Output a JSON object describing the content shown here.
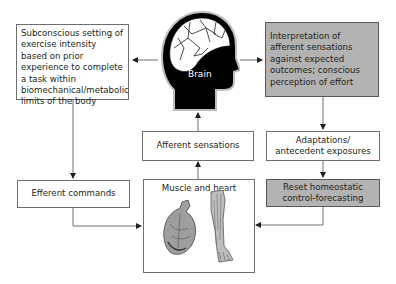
{
  "diagram": {
    "brain": {
      "label": "Brain",
      "icon": "head-brain-icon"
    },
    "subconscious_box": {
      "text": "Subconscious setting of exercise intensity based on prior experience to complete a task within biomechanical/metabolic limits of the body"
    },
    "interpretation_box": {
      "text": "Interpretation of afferent sensations against expected outcomes; conscious perception of effort",
      "fill": "#b3b3b3"
    },
    "afferent_box": {
      "text": "Afferent sensations"
    },
    "adaptations_box": {
      "text": "Adaptations/ antecedent exposures"
    },
    "efferent_box": {
      "text": "Efferent commands"
    },
    "reset_box": {
      "text": "Reset homeostatic control-forecasting",
      "fill": "#b3b3b3"
    },
    "muscle_heart_box": {
      "label": "Muscle and heart",
      "icons": [
        "heart-icon",
        "leg-muscle-icon"
      ]
    },
    "colors": {
      "line": "#6d6e70",
      "arrow": "#231f20",
      "gray_fill": "#b3b3b3",
      "head": "#000000"
    }
  }
}
